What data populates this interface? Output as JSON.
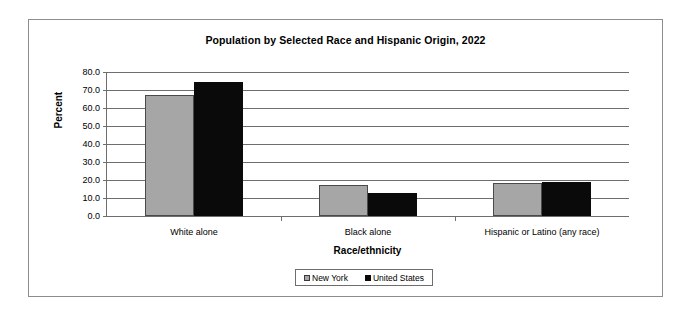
{
  "chart_data": {
    "type": "bar",
    "title": "Population by Selected Race and Hispanic Origin, 2022",
    "xlabel": "Race/ethnicity",
    "ylabel": "Percent",
    "categories": [
      "White alone",
      "Black alone",
      "Hispanic or Latino (any race)"
    ],
    "series": [
      {
        "name": "New York",
        "color": "#a6a6a6",
        "values": [
          67.4,
          17.3,
          18.4
        ]
      },
      {
        "name": "United States",
        "color": "#0a0a0a",
        "values": [
          74.4,
          12.9,
          18.8
        ]
      }
    ],
    "ylim": [
      0.0,
      80.0
    ],
    "ytick_step": 10.0,
    "ytick_labels": [
      "80.0",
      "70.0",
      "60.0",
      "50.0",
      "40.0",
      "30.0",
      "20.0",
      "10.0",
      "0.0"
    ],
    "ytick_values": [
      80.0,
      70.0,
      60.0,
      50.0,
      40.0,
      30.0,
      20.0,
      10.0,
      0.0
    ],
    "grid": true,
    "grid_axis": "y",
    "legend_position": "bottom-center",
    "legend_entries": [
      "New York",
      "United States"
    ],
    "plot_border_color": "#6e6e6e",
    "frame_border_color": "#8d8d8d"
  }
}
